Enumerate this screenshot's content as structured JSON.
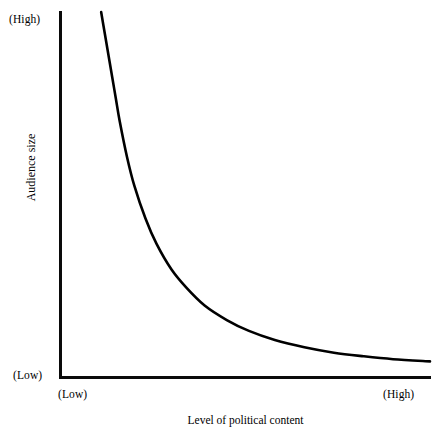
{
  "chart_data": {
    "type": "line",
    "title": "",
    "subtitle": "",
    "xlabel": "Level of political content",
    "ylabel": "Audience size",
    "x_tick_labels": [
      "(Low)",
      "(High)"
    ],
    "y_tick_labels": [
      "(Low)",
      "(High)"
    ],
    "grid": false,
    "legend": null,
    "annotations": [],
    "xlim": [
      0,
      100
    ],
    "ylim": [
      0,
      100
    ],
    "series": [
      {
        "name": "Audience size vs political content",
        "shape": "hyperbolic-decay",
        "stroke_color": "#000000",
        "stroke_width": 2.6,
        "x": [
          11,
          12,
          13,
          14,
          15,
          16,
          18,
          20,
          23,
          26,
          30,
          34,
          39,
          45,
          51,
          58,
          66,
          74,
          82,
          90,
          100
        ],
        "y": [
          100,
          94,
          88,
          82,
          76,
          70,
          60,
          52,
          43,
          36,
          29,
          24,
          19,
          15,
          12,
          9.5,
          7.5,
          6,
          5,
          4.2,
          3.6
        ]
      }
    ]
  },
  "axes": {
    "y_high_label": "(High)",
    "y_low_label": "(Low)",
    "x_low_label": "(Low)",
    "x_high_label": "(High)",
    "y_axis_title": "Audience size",
    "x_axis_title": "Level of political content",
    "axis_color": "#000000"
  }
}
